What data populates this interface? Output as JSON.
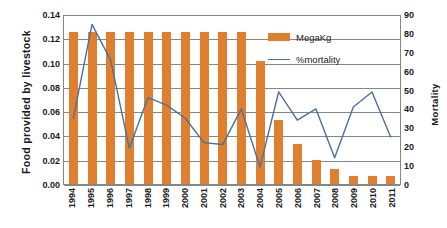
{
  "chart_data": {
    "type": "bar",
    "title": "",
    "xlabel": "",
    "ylabel": "Food provided by livestock",
    "y2label": "Mortality",
    "categories": [
      "1994",
      "1995",
      "1996",
      "1997",
      "1998",
      "1999",
      "2000",
      "2001",
      "2002",
      "2003",
      "2004",
      "2005",
      "2006",
      "2007",
      "2008",
      "2009",
      "2010",
      "2011"
    ],
    "series": [
      {
        "name": "MegaKg",
        "type": "bar",
        "axis": "left",
        "color": "#E0802E",
        "values": [
          0.125,
          0.125,
          0.125,
          0.125,
          0.125,
          0.125,
          0.125,
          0.125,
          0.125,
          0.125,
          0.101,
          0.053,
          0.033,
          0.02,
          0.012,
          0.007,
          0.007,
          0.007
        ]
      },
      {
        "name": "%mortality",
        "type": "line",
        "axis": "right",
        "color": "#4A6FA5",
        "values": [
          35,
          85,
          66,
          19,
          46,
          42,
          35,
          22,
          21,
          40,
          9,
          49,
          34,
          40,
          14,
          41,
          49,
          25
        ]
      }
    ],
    "ylim": [
      0.0,
      0.14
    ],
    "yticks": [
      "0.00",
      "0.02",
      "0.04",
      "0.06",
      "0.08",
      "0.10",
      "0.12",
      "0.14"
    ],
    "ytick_values": [
      0.0,
      0.02,
      0.04,
      0.06,
      0.08,
      0.1,
      0.12,
      0.14
    ],
    "y2lim": [
      0,
      90
    ],
    "y2ticks": [
      "0",
      "10",
      "20",
      "30",
      "40",
      "50",
      "60",
      "70",
      "80",
      "90"
    ],
    "y2tick_values": [
      0,
      10,
      20,
      30,
      40,
      50,
      60,
      70,
      80,
      90
    ],
    "grid": true,
    "legend_position": "inside-top-right",
    "legend": [
      "MegaKg",
      "%mortality"
    ]
  },
  "axes": {
    "left_title": "Food provided by livestock",
    "right_title": "Mortality"
  },
  "legend": {
    "bar_label": "MegaKg",
    "line_label": "%mortality"
  },
  "colors": {
    "bar": "#E0802E",
    "line": "#4A6FA5",
    "grid": "#868686",
    "text": "#1a1a1a",
    "background": "#ffffff"
  }
}
